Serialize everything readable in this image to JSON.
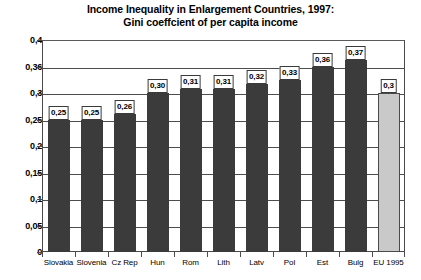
{
  "chart_data": {
    "type": "bar",
    "title": "Income Inequality in Enlargement Countries, 1997:",
    "subtitle": "Gini coeffcient of per capita income",
    "xlabel": "",
    "ylabel": "",
    "grid": true,
    "legend": "none",
    "categories": [
      "Slovakia",
      "Slovenia",
      "Cz Rep",
      "Hun",
      "Rom",
      "Lith",
      "Latv",
      "Pol",
      "Est",
      "Bulg",
      "EU 1995"
    ],
    "values": [
      0.25,
      0.25,
      0.26,
      0.3,
      0.31,
      0.31,
      0.32,
      0.33,
      0.36,
      0.37,
      0.3
    ],
    "value_labels": [
      "0,25",
      "0,25",
      "0,26",
      "0,30",
      "0,31",
      "0,31",
      "0,32",
      "0,33",
      "0,36",
      "0,37",
      "0,3"
    ],
    "highlight_index": 10,
    "ytick_labels": [
      "0",
      "0,05",
      "0,1",
      "0,15",
      "0,2",
      "0,25",
      "0,3",
      "0,36",
      "0,4"
    ],
    "ytick_values": [
      0,
      0.05,
      0.1,
      0.15,
      0.2,
      0.25,
      0.3,
      0.36,
      0.4
    ],
    "ylim": [
      0,
      0.4
    ],
    "bar_color": "#3b3b3b",
    "highlight_color": "#c9c9c9",
    "grid_color": "#4d4d4d",
    "background": "#ffffff"
  }
}
